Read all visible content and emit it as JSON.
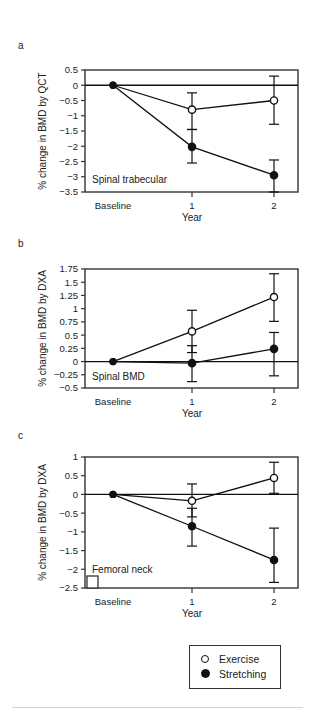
{
  "figure": {
    "panels": [
      {
        "letter": "a",
        "inline_label": "Spinal trabecular",
        "ylabel": "% change in BMD by QCT",
        "xlabel": "Year",
        "xticklabels": [
          "Baseline",
          "1",
          "2"
        ],
        "yticklabels": [
          "0.5",
          "0",
          "−0.5",
          "−1",
          "−1.5",
          "−2",
          "−2.5",
          "−3",
          "−3.5"
        ]
      },
      {
        "letter": "b",
        "inline_label": "Spinal BMD",
        "ylabel": "% change in BMD by DXA",
        "xlabel": "Year",
        "xticklabels": [
          "Baseline",
          "1",
          "2"
        ],
        "yticklabels": [
          "1.75",
          "1.5",
          "1.25",
          "1",
          "0.75",
          "0.5",
          "0.25",
          "0",
          "−0.25",
          "−0.5"
        ]
      },
      {
        "letter": "c",
        "inline_label": "Femoral neck",
        "ylabel": "% change in BMD by DXA",
        "xlabel": "Year",
        "xticklabels": [
          "Baseline",
          "1",
          "2"
        ],
        "yticklabels": [
          "1",
          "0.5",
          "0",
          "−0.5",
          "−1",
          "−1.5",
          "−2",
          "−2.5"
        ]
      }
    ],
    "legend": {
      "items": [
        {
          "marker": "open-circle",
          "label": "Exercise"
        },
        {
          "marker": "filled-circle",
          "label": "Stretching"
        }
      ]
    },
    "colors": {
      "line": "#111111",
      "frame": "#333333",
      "text": "#1a1a1a",
      "rule": "#d0d0d0"
    }
  },
  "chart_data": [
    {
      "type": "line",
      "panel": "a",
      "title": "Spinal trabecular",
      "xlabel": "Year",
      "ylabel": "% change in BMD by QCT",
      "x": [
        "Baseline",
        "1",
        "2"
      ],
      "ylim": [
        -3.5,
        0.5
      ],
      "yticks": [
        0.5,
        0,
        -0.5,
        -1,
        -1.5,
        -2,
        -2.5,
        -3,
        -3.5
      ],
      "grid": false,
      "zero_line": true,
      "series": [
        {
          "name": "Exercise",
          "marker": "open-circle",
          "values": [
            0,
            -0.8,
            -0.5
          ],
          "err_low": [
            0,
            -1.45,
            -1.28
          ],
          "err_high": [
            0,
            -0.25,
            0.3
          ]
        },
        {
          "name": "Stretching",
          "marker": "filled-circle",
          "values": [
            0,
            -2.02,
            -2.95
          ],
          "err_low": [
            0,
            -2.55,
            -3.5
          ],
          "err_high": [
            0,
            -1.45,
            -2.45
          ]
        }
      ]
    },
    {
      "type": "line",
      "panel": "b",
      "title": "Spinal BMD",
      "xlabel": "Year",
      "ylabel": "% change in BMD by DXA",
      "x": [
        "Baseline",
        "1",
        "2"
      ],
      "ylim": [
        -0.5,
        1.75
      ],
      "yticks": [
        1.75,
        1.5,
        1.25,
        1,
        0.75,
        0.5,
        0.25,
        0,
        -0.25,
        -0.5
      ],
      "grid": false,
      "zero_line": true,
      "series": [
        {
          "name": "Exercise",
          "marker": "open-circle",
          "values": [
            0,
            0.57,
            1.22
          ],
          "err_low": [
            0,
            0.17,
            0.76
          ],
          "err_high": [
            0,
            0.97,
            1.66
          ]
        },
        {
          "name": "Stretching",
          "marker": "filled-circle",
          "values": [
            0,
            -0.03,
            0.24
          ],
          "err_low": [
            0,
            -0.38,
            -0.27
          ],
          "err_high": [
            0,
            0.3,
            0.55
          ]
        }
      ]
    },
    {
      "type": "line",
      "panel": "c",
      "title": "Femoral neck",
      "xlabel": "Year",
      "ylabel": "% change in BMD by DXA",
      "x": [
        "Baseline",
        "1",
        "2"
      ],
      "ylim": [
        -2.5,
        1.0
      ],
      "yticks": [
        1,
        0.5,
        0,
        -0.5,
        -1,
        -1.5,
        -2,
        -2.5
      ],
      "grid": false,
      "zero_line": true,
      "series": [
        {
          "name": "Exercise",
          "marker": "open-circle",
          "values": [
            0,
            -0.17,
            0.44
          ],
          "err_low": [
            0,
            -0.6,
            0.03
          ],
          "err_high": [
            0,
            0.28,
            0.86
          ]
        },
        {
          "name": "Stretching",
          "marker": "filled-circle",
          "values": [
            0,
            -0.85,
            -1.75
          ],
          "err_low": [
            0,
            -1.38,
            -2.35
          ],
          "err_high": [
            0,
            -0.37,
            -0.9
          ]
        }
      ]
    }
  ]
}
